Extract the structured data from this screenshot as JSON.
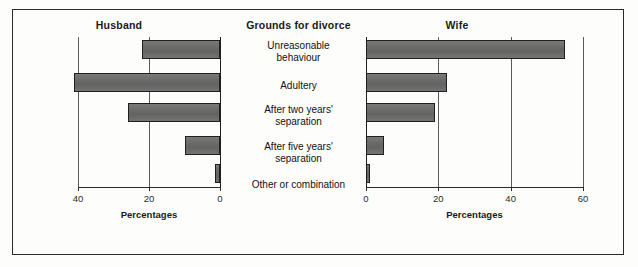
{
  "chart_data": {
    "type": "bar",
    "orientation": "horizontal",
    "title": "",
    "center_header": "Grounds for divorce",
    "categories": [
      "Unreasonable behaviour",
      "Adultery",
      "After two years' separation",
      "After five years' separation",
      "Other or combination"
    ],
    "category_lines": [
      [
        "Unreasonable",
        "behaviour"
      ],
      [
        "Adultery"
      ],
      [
        "After two years'",
        "separation"
      ],
      [
        "After five years'",
        "separation"
      ],
      [
        "Other or combination"
      ]
    ],
    "series": [
      {
        "name": "Husband",
        "values": [
          22,
          41,
          26,
          10,
          1.5
        ]
      },
      {
        "name": "Wife",
        "values": [
          55,
          22.5,
          19,
          5,
          1
        ]
      }
    ],
    "panels": [
      {
        "name": "Husband",
        "xlabel": "Percentages",
        "ticks": [
          40,
          20,
          0
        ],
        "tick_labels": [
          "40",
          "20",
          "0"
        ],
        "xlim": [
          0,
          40
        ],
        "direction": "right-to-left",
        "grid": true
      },
      {
        "name": "Wife",
        "xlabel": "Percentages",
        "ticks": [
          0,
          20,
          40,
          60
        ],
        "tick_labels": [
          "0",
          "20",
          "40",
          "60"
        ],
        "xlim": [
          0,
          60
        ],
        "direction": "left-to-right",
        "grid": true
      }
    ],
    "bar_color": "#6f6f6f",
    "bar_border_color": "#1f1f1f",
    "grid_color": "#5a5a5a",
    "axis_color": "#2b2b2b",
    "background": "#fdfdfb"
  }
}
